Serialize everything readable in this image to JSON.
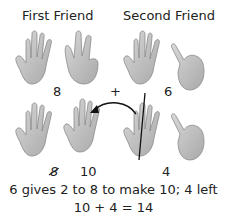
{
  "top": {
    "first_friend_label": "First Friend",
    "second_friend_label": "Second Friend",
    "first_value": "8",
    "operator": "+",
    "second_value": "6"
  },
  "bottom": {
    "struck_value": "8",
    "new_first_value": "10",
    "remaining_value": "4"
  },
  "caption": {
    "line1": "6 gives 2 to 8 to make 10;  4 left",
    "line2": "10 + 4 = 14"
  },
  "hands": {
    "top": [
      "open-hand-5",
      "hand-3-fingers",
      "open-hand-5",
      "hand-1-pinky"
    ],
    "bottom": [
      "open-hand-5",
      "hand-5-fingers",
      "open-hand-5-split",
      "hand-1-pinky"
    ]
  },
  "colors": {
    "skin": "#c9c9c9",
    "outline": "#8a8a8a",
    "text": "#222222"
  }
}
